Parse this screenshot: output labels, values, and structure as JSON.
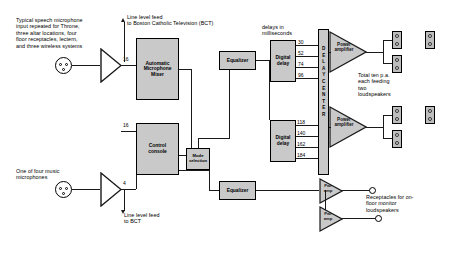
{
  "diagram": {
    "annotations": {
      "speech_mic": "Typical speech microphone\ninput repeated for Throne,\nthree altar locations, four\nfloor receptacles, lectern,\nand three wireless systems",
      "music_mic": "One of four music\nmicrophones",
      "bct_top": "Line level feed\nto  Boston Catholic Television (BCT)",
      "bct_bottom": "Line level feed\nto BCT",
      "delays_header": "delays in\nmilliseconds",
      "total_pa": "Total ten p.a.\neach feeding\ntwo\nloudspeakers",
      "receptacles": "Receptacles for on-\nfloor monitor\nloudspeakers"
    },
    "blocks": {
      "auto_mixer": "Automatic\nMicrophone\nMixer",
      "control_console": "Control\nconsole",
      "mode_selection": "Mode\nselection",
      "equalizer_top": "Equalizer",
      "equalizer_bottom": "Equalizer",
      "digital_delay_top": "Digital\ndelay",
      "digital_delay_bottom": "Digital\ndelay",
      "power_amp_top": "Power\namplifier",
      "power_amp_bottom": "Power\namplifier",
      "monitor_amp_top": "Pwr\namp",
      "monitor_amp_bottom": "Pwr\namp",
      "delay_center": "DELAYCENTER"
    },
    "channel_counts": {
      "mixer_inputs": "16",
      "console_inputs": "16",
      "music_inputs": "4"
    },
    "delay_values_top": [
      "30",
      "52",
      "74",
      "96"
    ],
    "delay_values_bottom": [
      "118",
      "140",
      "162",
      "184"
    ],
    "colors": {
      "block_fill": "#c9c9c9",
      "line": "#1a1a1a",
      "speaker_fill": "#bdbdbd",
      "background": "#ffffff"
    }
  }
}
